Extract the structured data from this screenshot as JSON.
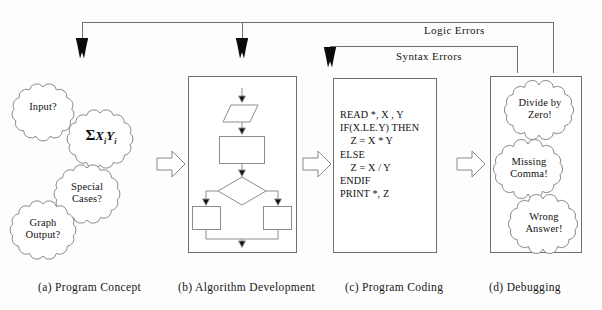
{
  "figure": {
    "ink_color": "#1a1a1a",
    "line_color": "#6f6f6f",
    "background": "#fdfdfd"
  },
  "feedback_labels": {
    "logic": "Logic Errors",
    "syntax": "Syntax Errors"
  },
  "panels": [
    {
      "key": "a",
      "caption": "(a) Program Concept",
      "clouds": [
        {
          "text": "Input?"
        },
        {
          "text": "ΣXiYi",
          "formula": true
        },
        {
          "text": "Special\nCases?"
        },
        {
          "text": "Graph\nOutput?"
        }
      ]
    },
    {
      "key": "b",
      "caption": "(b) Algorithm Development",
      "flowchart": {
        "nodes": [
          "input-parallelogram",
          "process-rectangle",
          "decision-diamond",
          "branch-rectangle-left",
          "branch-rectangle-right"
        ]
      }
    },
    {
      "key": "c",
      "caption": "(c) Program Coding",
      "code": "READ *, X , Y\nIF(X.LE.Y) THEN\n    Z = X * Y\nELSE\n    Z = X / Y\nENDIF\nPRINT *, Z"
    },
    {
      "key": "d",
      "caption": "(d) Debugging",
      "clouds": [
        {
          "text": "Divide by\nZero!"
        },
        {
          "text": "Missing\nComma!"
        },
        {
          "text": "Wrong\nAnswer!"
        }
      ]
    }
  ]
}
